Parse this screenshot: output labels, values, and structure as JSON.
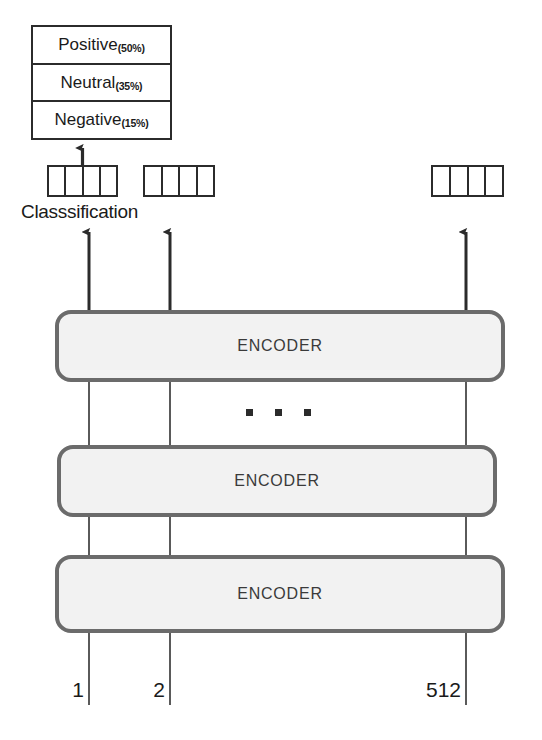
{
  "diagram": {
    "background_color": "#ffffff",
    "line_color": "#2b2b2b",
    "encoder_fill": "#f2f2f2",
    "encoder_border": "#6b6b6b"
  },
  "classification": {
    "caption": "Classsification",
    "classes": [
      {
        "label": "Positive",
        "percent": "(50%)",
        "value": 50
      },
      {
        "label": "Neutral",
        "percent": "(35%)",
        "value": 35
      },
      {
        "label": "Negative",
        "percent": "(15%)",
        "value": 15
      }
    ]
  },
  "token_boxes": [
    {
      "name": "token-box-1",
      "cells": 4
    },
    {
      "name": "token-box-2",
      "cells": 4
    },
    {
      "name": "token-box-3",
      "cells": 4
    }
  ],
  "encoders": [
    {
      "label": "ENCODER",
      "position": "top"
    },
    {
      "label": "ENCODER",
      "position": "middle"
    },
    {
      "label": "ENCODER",
      "position": "bottom"
    }
  ],
  "ellipsis": {
    "dots": 3,
    "meaning": "repeated encoder layers omitted"
  },
  "inputs": [
    {
      "index": "1"
    },
    {
      "index": "2"
    },
    {
      "index": "512"
    }
  ]
}
